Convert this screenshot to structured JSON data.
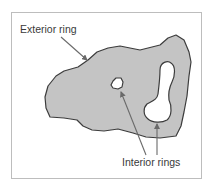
{
  "diagram": {
    "labels": {
      "exterior": "Exterior ring",
      "interior": "Interior rings"
    },
    "colors": {
      "frame": "#bdbdbd",
      "polygon_fill": "#c4c4c4",
      "polygon_stroke": "#3c3c3c",
      "hole_fill": "#ffffff",
      "arrow": "#6a6a6a",
      "text": "#3a3a3a"
    },
    "elements": [
      {
        "id": "exterior-ring",
        "type": "polygon-outer-boundary"
      },
      {
        "id": "interior-ring-small",
        "type": "polygon-hole"
      },
      {
        "id": "interior-ring-peanut",
        "type": "polygon-hole"
      }
    ]
  }
}
